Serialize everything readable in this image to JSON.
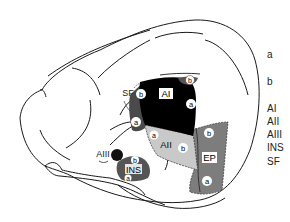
{
  "diagram": {
    "type": "brain-lateral-view",
    "regions": [
      {
        "id": "AI",
        "label": "AI",
        "fill": "#000000",
        "subregions": [
          "b",
          "a",
          "b"
        ]
      },
      {
        "id": "AII",
        "label": "AII",
        "fill": "#c8c8c8",
        "subregions": [
          "a",
          "b"
        ]
      },
      {
        "id": "AIII",
        "label": "AIII",
        "fill": "#111111"
      },
      {
        "id": "INS",
        "label": "INS",
        "fill": "#5a5a5a",
        "subregions": [
          "b",
          "a"
        ]
      },
      {
        "id": "EP",
        "label": "EP",
        "fill": "#7a7a7a",
        "subregions": [
          "b",
          "a"
        ]
      },
      {
        "id": "SF",
        "label": "SF"
      }
    ],
    "labels": {
      "ai": "AI",
      "aii": "AII",
      "aiii": "AIII",
      "ins": "INS",
      "ep": "EP",
      "sf": "SF",
      "sub_a": "a",
      "sub_b": "b"
    }
  },
  "legend": {
    "items": [
      {
        "label": "a",
        "y": 50
      },
      {
        "label": "b",
        "y": 77
      },
      {
        "label": "AI",
        "y": 104
      },
      {
        "label": "AII",
        "y": 117
      },
      {
        "label": "AIII",
        "y": 130
      },
      {
        "label": "INS",
        "y": 143
      },
      {
        "label": "SF",
        "y": 157
      }
    ]
  },
  "colors": {
    "outline": "#1a1a1a",
    "ai_fill": "#000000",
    "aii_fill": "#c9c9c9",
    "ep_fill": "#7d7d7d",
    "ins_fill": "#555555",
    "dark_patch": "#4a4a4a",
    "circle_fill": "#ffffff"
  }
}
